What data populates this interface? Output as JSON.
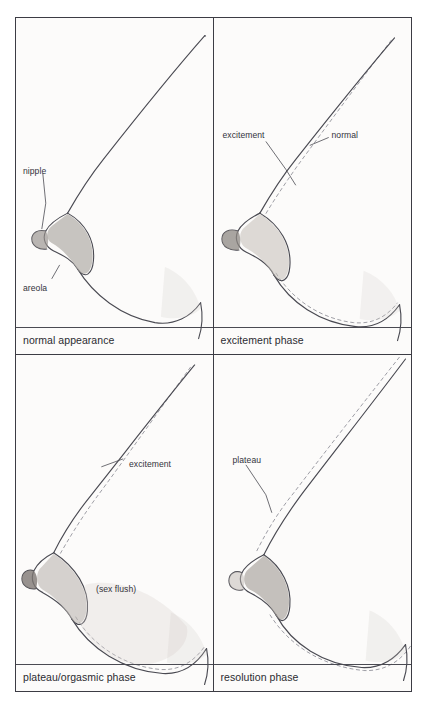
{
  "figure": {
    "alt_description": "Four-panel medical line drawing showing side-view breast contour changes across the sexual response cycle",
    "background_color": "#fcfbfa",
    "frame_color": "#3c3c44",
    "contour_line_color": "#4a4a52",
    "reference_line_color": "#8d8d96",
    "areola_shade_color": "#b3aea9",
    "flush_shade_color": "#d8d2cd"
  },
  "panels": [
    {
      "id": "normal-appearance",
      "caption": "normal appearance",
      "position": "top-left",
      "labels": [
        {
          "name": "nipple",
          "text": "nipple",
          "x": 7,
          "y": 148
        },
        {
          "name": "areola",
          "text": "areola",
          "x": 7,
          "y": 265
        }
      ]
    },
    {
      "id": "excitement-phase",
      "caption": "excitement phase",
      "position": "top-right",
      "labels": [
        {
          "name": "excitement",
          "text": "excitement",
          "x": 9,
          "y": 112
        },
        {
          "name": "normal",
          "text": "normal",
          "x": 118,
          "y": 112
        }
      ]
    },
    {
      "id": "plateau-orgasmic-phase",
      "caption": "plateau/orgasmic phase",
      "position": "bottom-left",
      "labels": [
        {
          "name": "excitement",
          "text": "excitement",
          "x": 113,
          "y": 104
        },
        {
          "name": "sex-flush",
          "text": "(sex flush)",
          "x": 80,
          "y": 229
        }
      ]
    },
    {
      "id": "resolution-phase",
      "caption": "resolution phase",
      "position": "bottom-right",
      "labels": [
        {
          "name": "plateau",
          "text": "plateau",
          "x": 19,
          "y": 100
        }
      ]
    }
  ]
}
